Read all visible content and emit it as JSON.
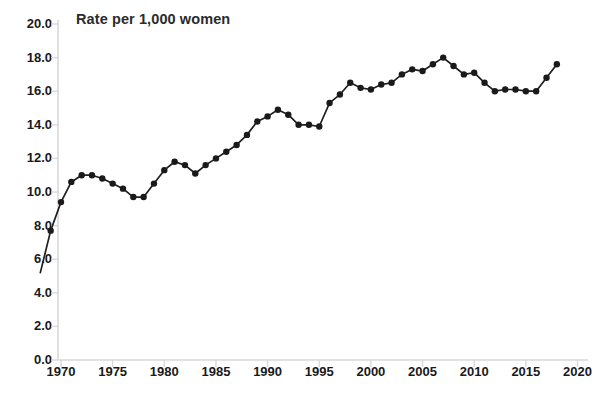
{
  "chart_data": {
    "type": "line",
    "title": "Rate per 1,000 women",
    "xlabel": "",
    "ylabel": "",
    "ylim": [
      0.0,
      20.0
    ],
    "xlim": [
      1968,
      2021
    ],
    "yticks": [
      "0.0",
      "2.0",
      "4.0",
      "6.0",
      "8.0",
      "10.0",
      "12.0",
      "14.0",
      "16.0",
      "18.0",
      "20.0"
    ],
    "ytick_values": [
      0.0,
      2.0,
      4.0,
      6.0,
      8.0,
      10.0,
      12.0,
      14.0,
      16.0,
      18.0,
      20.0
    ],
    "xticks": [
      "1970",
      "1975",
      "1980",
      "1985",
      "1990",
      "1995",
      "2000",
      "2005",
      "2010",
      "2015",
      "2020"
    ],
    "xtick_values": [
      1970,
      1975,
      1980,
      1985,
      1990,
      1995,
      2000,
      2005,
      2010,
      2015,
      2020
    ],
    "grid": false,
    "legend": false,
    "legend_position": "none",
    "markers": true,
    "marker_style": "circle",
    "line_color": "#1a1a1a",
    "marker_color": "#1a1a1a",
    "axis_color": "#d4d4d4",
    "x": [
      1968,
      1969,
      1970,
      1971,
      1972,
      1973,
      1974,
      1975,
      1976,
      1977,
      1978,
      1979,
      1980,
      1981,
      1982,
      1983,
      1984,
      1985,
      1986,
      1987,
      1988,
      1989,
      1990,
      1991,
      1992,
      1993,
      1994,
      1995,
      1996,
      1997,
      1998,
      1999,
      2000,
      2001,
      2002,
      2003,
      2004,
      2005,
      2006,
      2007,
      2008,
      2009,
      2010,
      2011,
      2012,
      2013,
      2014,
      2015,
      2016,
      2017,
      2018
    ],
    "values": [
      5.2,
      7.7,
      9.4,
      10.6,
      11.0,
      11.0,
      10.8,
      10.5,
      10.2,
      9.7,
      9.7,
      10.5,
      11.3,
      11.8,
      11.6,
      11.1,
      11.6,
      12.0,
      12.4,
      12.8,
      13.4,
      14.2,
      14.5,
      14.9,
      14.6,
      14.0,
      14.0,
      13.9,
      15.3,
      15.8,
      16.5,
      16.2,
      16.1,
      16.4,
      16.5,
      17.0,
      17.3,
      17.2,
      17.6,
      18.0,
      17.5,
      17.0,
      17.1,
      16.5,
      16.0,
      16.1,
      16.1,
      16.0,
      16.0,
      16.8,
      17.6
    ],
    "series": [
      {
        "name": "Rate per 1,000 women",
        "values": [
          5.2,
          7.7,
          9.4,
          10.6,
          11.0,
          11.0,
          10.8,
          10.5,
          10.2,
          9.7,
          9.7,
          10.5,
          11.3,
          11.8,
          11.6,
          11.1,
          11.6,
          12.0,
          12.4,
          12.8,
          13.4,
          14.2,
          14.5,
          14.9,
          14.6,
          14.0,
          14.0,
          13.9,
          15.3,
          15.8,
          16.5,
          16.2,
          16.1,
          16.4,
          16.5,
          17.0,
          17.3,
          17.2,
          17.6,
          18.0,
          17.5,
          17.0,
          17.1,
          16.5,
          16.0,
          16.1,
          16.1,
          16.0,
          16.0,
          16.8,
          17.6
        ]
      }
    ]
  },
  "footnote": {
    "text": ""
  }
}
